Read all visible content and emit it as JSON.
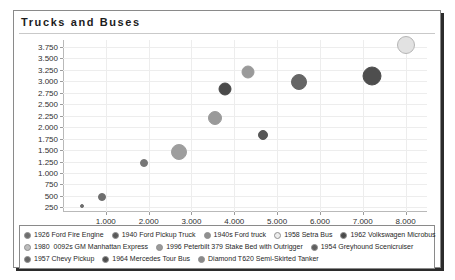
{
  "chart_data": {
    "type": "scatter",
    "title": "Trucks and Buses",
    "xlabel": "",
    "ylabel": "",
    "xlim": [
      0,
      8500
    ],
    "ylim": [
      150,
      3900
    ],
    "grid": true,
    "legend_position": "bottom",
    "x_ticks": [
      "1.000",
      "2.000",
      "3.000",
      "4.000",
      "5.000",
      "6.000",
      "7.000",
      "8.000"
    ],
    "x_tick_values": [
      1000,
      2000,
      3000,
      4000,
      5000,
      6000,
      7000,
      8000
    ],
    "y_ticks": [
      "250",
      "500",
      "750",
      "1.000",
      "1.250",
      "1.500",
      "1.750",
      "2.000",
      "2.250",
      "2.500",
      "2.750",
      "3.000",
      "3.250",
      "3.500",
      "3.750"
    ],
    "y_tick_values": [
      250,
      500,
      750,
      1000,
      1250,
      1500,
      1750,
      2000,
      2250,
      2500,
      2750,
      3000,
      3250,
      3500,
      3750
    ],
    "points": [
      {
        "name": "1926 Ford Fire Engine",
        "x": 450,
        "y": 270,
        "size": 4,
        "color": "#6e6e6e"
      },
      {
        "name": "1940 Ford Pickup Truck",
        "x": 900,
        "y": 480,
        "size": 8,
        "color": "#6e6e6e"
      },
      {
        "name": "1940s Ford truck",
        "x": 1880,
        "y": 1220,
        "size": 8,
        "color": "#777777"
      },
      {
        "name": "1958 Setra Bus",
        "x": 2700,
        "y": 1460,
        "size": 16,
        "color": "#9e9e9e"
      },
      {
        "name": "1962 Volkswagen Microbus",
        "x": 3560,
        "y": 2210,
        "size": 14,
        "color": "#9a9a9a"
      },
      {
        "name": "19800092s GM Manhattan Express",
        "x": 3790,
        "y": 2840,
        "size": 13,
        "color": "#4a4a4a"
      },
      {
        "name": "1996 Peterbilt 379 Stake Bed with Outrigger",
        "x": 4330,
        "y": 3210,
        "size": 13,
        "color": "#9a9a9a"
      },
      {
        "name": "1954 Greyhound Scenicruiser",
        "x": 4670,
        "y": 1820,
        "size": 10,
        "color": "#575757"
      },
      {
        "name": "1957 Chevy Pickup",
        "x": 5520,
        "y": 2990,
        "size": 16,
        "color": "#666666"
      },
      {
        "name": "1964 Mercedes Tour Bus",
        "x": 7220,
        "y": 3120,
        "size": 19,
        "color": "#4e4e4e"
      },
      {
        "name": "Diamond T620 Semi-Skirted Tanker",
        "x": 8000,
        "y": 3790,
        "size": 18,
        "color": "#e2e2e2"
      }
    ]
  },
  "legend": {
    "rows": [
      [
        {
          "label": "1926 Ford Fire Engine",
          "color": "#6e6e6e"
        },
        {
          "label": "1940 Ford Pickup Truck",
          "color": "#595959"
        },
        {
          "label": "1940s Ford truck",
          "color": "#8f8f8f"
        },
        {
          "label": "1958 Setra Bus",
          "color": "#ededed"
        },
        {
          "label": "1962 Volkswagen Microbus",
          "color": "#4a4a4a"
        }
      ],
      [
        {
          "label": "19800092s GM Manhattan Express",
          "color": "#bdbdbd"
        },
        {
          "label": "1996 Peterbilt 379 Stake Bed with Outrigger",
          "color": "#9a9a9a"
        },
        {
          "label": "1954 Greyhound Scenicruiser",
          "color": "#5e5e5e"
        }
      ],
      [
        {
          "label": "1957 Chevy Pickup",
          "color": "#666666"
        },
        {
          "label": "1964 Mercedes Tour Bus",
          "color": "#4e4e4e"
        },
        {
          "label": "Diamond T620 Semi-Skirted Tanker",
          "color": "#8a8a8a"
        }
      ]
    ]
  },
  "colors": {
    "frame_border": "#8a8a8a",
    "shadow": "#2b2b2b",
    "grid": "#ededed",
    "axis": "#b9b9b9",
    "text": "#1f1f1f"
  }
}
